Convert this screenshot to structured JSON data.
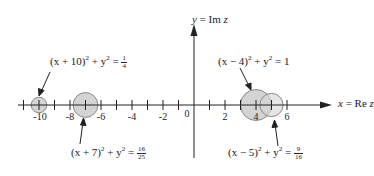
{
  "diagram": {
    "axes": {
      "x_label": "x = Re z",
      "y_label": "y = Im z",
      "x_ticks": [
        "-10",
        "-8",
        "-6",
        "-4",
        "-2",
        "0",
        "2",
        "4",
        "6"
      ]
    },
    "circles": [
      {
        "equation_lhs": "(x + 10)",
        "equation_mid": " + y",
        "rhs_num": "1",
        "rhs_den": "4",
        "center": -10,
        "radius": 0.5
      },
      {
        "equation_lhs": "(x + 7)",
        "equation_mid": " + y",
        "rhs_num": "16",
        "rhs_den": "25",
        "center": -7,
        "radius": 0.8
      },
      {
        "equation_lhs": "(x − 4)",
        "equation_mid": " + y",
        "rhs_value": "1",
        "center": 4,
        "radius": 1
      },
      {
        "equation_lhs": "(x − 5)",
        "equation_mid": " + y",
        "rhs_num": "9",
        "rhs_den": "16",
        "center": 5,
        "radius": 0.75
      }
    ],
    "colors": {
      "circle_fill": "#d4d4d4",
      "circle_stroke": "#8a8a8a",
      "axis": "#222222"
    }
  }
}
